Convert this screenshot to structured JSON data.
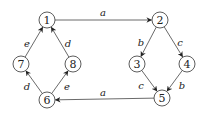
{
  "diagram": {
    "type": "directed-graph",
    "node_radius": 8,
    "colors": {
      "stroke": "#333333",
      "fill": "#ffffff",
      "text": "#222222"
    },
    "nodes": [
      {
        "id": "1",
        "label": "1",
        "x": 47,
        "y": 20
      },
      {
        "id": "2",
        "label": "2",
        "x": 160,
        "y": 20
      },
      {
        "id": "3",
        "label": "3",
        "x": 137,
        "y": 64
      },
      {
        "id": "4",
        "label": "4",
        "x": 187,
        "y": 64
      },
      {
        "id": "5",
        "label": "5",
        "x": 162,
        "y": 98
      },
      {
        "id": "6",
        "label": "6",
        "x": 47,
        "y": 100
      },
      {
        "id": "7",
        "label": "7",
        "x": 21,
        "y": 64
      },
      {
        "id": "8",
        "label": "8",
        "x": 73,
        "y": 64
      }
    ],
    "edges": [
      {
        "from": "1",
        "to": "2",
        "label": "a",
        "lx": 103,
        "ly": 12
      },
      {
        "from": "2",
        "to": "3",
        "label": "b",
        "lx": 141,
        "ly": 42
      },
      {
        "from": "2",
        "to": "4",
        "label": "c",
        "lx": 180,
        "ly": 42
      },
      {
        "from": "3",
        "to": "5",
        "label": "c",
        "lx": 141,
        "ly": 85
      },
      {
        "from": "4",
        "to": "5",
        "label": "b",
        "lx": 182,
        "ly": 85
      },
      {
        "from": "5",
        "to": "6",
        "label": "a",
        "lx": 103,
        "ly": 92
      },
      {
        "from": "6",
        "to": "7",
        "label": "d",
        "lx": 27,
        "ly": 86
      },
      {
        "from": "6",
        "to": "8",
        "label": "e",
        "lx": 67,
        "ly": 86
      },
      {
        "from": "7",
        "to": "1",
        "label": "e",
        "lx": 27,
        "ly": 43
      },
      {
        "from": "8",
        "to": "1",
        "label": "d",
        "lx": 68,
        "ly": 43
      }
    ]
  }
}
